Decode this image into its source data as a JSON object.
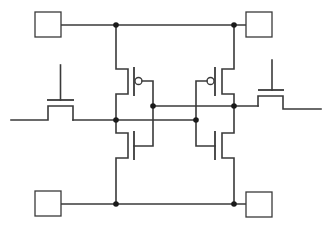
{
  "diagram": {
    "type": "circuit-schematic",
    "colors": {
      "wire": "#3a3a3a",
      "node": "#1a1a1a",
      "background": "#ffffff"
    },
    "terminals": [
      {
        "id": "terminal-top-left",
        "label": ""
      },
      {
        "id": "terminal-top-right",
        "label": ""
      },
      {
        "id": "terminal-bottom-left",
        "label": ""
      },
      {
        "id": "terminal-bottom-right",
        "label": ""
      }
    ],
    "components": [
      {
        "id": "pmos-left",
        "kind": "PMOS"
      },
      {
        "id": "nmos-left",
        "kind": "NMOS"
      },
      {
        "id": "pmos-right",
        "kind": "PMOS"
      },
      {
        "id": "nmos-right",
        "kind": "NMOS"
      },
      {
        "id": "access-left",
        "kind": "NMOS access"
      },
      {
        "id": "access-right",
        "kind": "NMOS access"
      }
    ],
    "nodes": [
      "top-rail-left",
      "top-rail-right",
      "bottom-rail-left",
      "bottom-rail-right",
      "storage-node-left",
      "storage-node-right",
      "gate-node-left",
      "gate-node-right"
    ]
  }
}
